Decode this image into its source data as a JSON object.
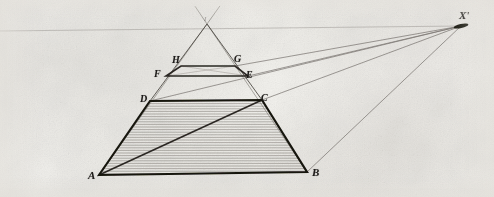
{
  "figure": {
    "kind": "perspective-construction-diagram",
    "medium": "engraving on aged paper",
    "background_color": "#f2f1ee",
    "ink_color": "#1d1b19",
    "faint_ink_color": "#8d8884",
    "width": 494,
    "height": 197
  },
  "labels": {
    "apex": "I",
    "h": "H",
    "g": "G",
    "f": "F",
    "e": "E",
    "d": "D",
    "c": "C",
    "a": "A",
    "b": "B",
    "vanishing_point": "X'"
  },
  "points": {
    "apex": {
      "x": 207,
      "y": 24
    },
    "h": {
      "x": 181,
      "y": 66
    },
    "g": {
      "x": 235,
      "y": 66
    },
    "f": {
      "x": 166,
      "y": 76
    },
    "e": {
      "x": 248,
      "y": 76
    },
    "d": {
      "x": 150,
      "y": 101
    },
    "c": {
      "x": 262,
      "y": 100
    },
    "a": {
      "x": 99,
      "y": 175
    },
    "b": {
      "x": 307,
      "y": 172
    },
    "vanishing_point": {
      "x": 461,
      "y": 26
    }
  },
  "label_positions": {
    "apex": {
      "x": 204,
      "y": 16
    },
    "h": {
      "x": 172,
      "y": 55
    },
    "g": {
      "x": 234,
      "y": 54
    },
    "f": {
      "x": 154,
      "y": 69
    },
    "e": {
      "x": 246,
      "y": 70
    },
    "d": {
      "x": 140,
      "y": 94
    },
    "c": {
      "x": 261,
      "y": 93
    },
    "a": {
      "x": 88,
      "y": 170
    },
    "b": {
      "x": 312,
      "y": 167
    },
    "vanishing_point": {
      "x": 459,
      "y": 10
    }
  },
  "shapes": {
    "base_trapezoid": {
      "name": "ABCD",
      "vertices": [
        "a",
        "b",
        "c",
        "d"
      ],
      "fill": "horizontal-hatching",
      "hatch_spacing_px": 2.6,
      "hatch_color": "#6f6a65",
      "stroke_width": 2.2
    },
    "upper_triangle": {
      "name": "I-A-B projection triangle",
      "vertices": [
        "apex",
        "d",
        "c"
      ],
      "stroke_width": 0.9
    },
    "upper_parallelogram": {
      "name": "HGEF",
      "vertices": [
        "h",
        "g",
        "e",
        "f"
      ],
      "stroke_width": 1.6
    }
  },
  "lines": {
    "horizon": {
      "name": "horizon-line",
      "from": {
        "x": -2,
        "y": 31
      },
      "to": {
        "x": 461,
        "y": 26
      },
      "stroke_width": 0.7,
      "faint": true
    },
    "diagonal_ac": {
      "name": "diagonal-A-to-C",
      "from": "a",
      "to": "c",
      "stroke_width": 1.5
    },
    "converging_rays": [
      {
        "name": "ray-D-to-vanishing-point",
        "from": "d",
        "to": "vanishing_point"
      },
      {
        "name": "ray-C-to-vanishing-point",
        "from": "c",
        "to": "vanishing_point"
      },
      {
        "name": "ray-E-to-vanishing-point",
        "from": "e",
        "to": "vanishing_point"
      },
      {
        "name": "ray-G-to-vanishing-point",
        "from": "g",
        "to": "vanishing_point"
      },
      {
        "name": "ray-B-to-vanishing-point",
        "from": "b",
        "to": "vanishing_point"
      }
    ],
    "side_guides": [
      {
        "name": "guide-A-through-D-to-apex",
        "from": "a",
        "to": "apex"
      },
      {
        "name": "guide-B-through-C-to-apex",
        "from": "b",
        "to": "apex"
      }
    ],
    "inner_guides": [
      {
        "name": "guide-F-to-G",
        "from": "f",
        "to": "g"
      },
      {
        "name": "guide-H-to-E",
        "from": "h",
        "to": "e"
      }
    ]
  }
}
